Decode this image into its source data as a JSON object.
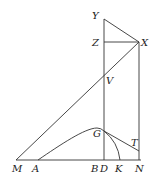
{
  "diagram": {
    "type": "geometry-figure",
    "labels": {
      "Y": "Y",
      "Z": "Z",
      "X": "X",
      "V": "V",
      "G": "G",
      "T": "T",
      "M": "M",
      "A": "A",
      "B": "B",
      "D": "D",
      "K": "K",
      "N": "N"
    },
    "points": {
      "Y": [
        104,
        19
      ],
      "Z": [
        104,
        42
      ],
      "X": [
        139,
        42
      ],
      "V": [
        104,
        77
      ],
      "G": [
        104,
        131
      ],
      "M": [
        16,
        160
      ],
      "A": [
        38,
        160
      ],
      "B": [
        96,
        160
      ],
      "D": [
        104,
        160
      ],
      "K": [
        120,
        160
      ],
      "N": [
        140,
        160
      ]
    },
    "segments": [
      [
        "M",
        "N"
      ],
      [
        "Y",
        "D"
      ],
      [
        "Y",
        "X"
      ],
      [
        "Z",
        "X"
      ],
      [
        "X",
        "N"
      ],
      [
        "M",
        "X"
      ],
      [
        "G",
        "N_upper"
      ]
    ],
    "curves": [
      "A to G (convex arc peaking near G)",
      "G to K (arc)"
    ]
  }
}
